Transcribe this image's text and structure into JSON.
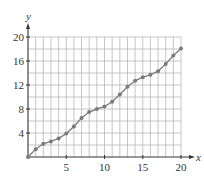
{
  "chart_data": {
    "type": "line",
    "title": "",
    "xlabel": "x",
    "ylabel": "y",
    "xlim": [
      0,
      20
    ],
    "ylim": [
      0,
      20
    ],
    "x_ticks": [
      5,
      10,
      15,
      20
    ],
    "y_ticks": [
      4,
      8,
      12,
      16,
      20
    ],
    "x_tick_labels": [
      "5",
      "10",
      "15",
      "20"
    ],
    "y_tick_labels": [
      "4",
      "8",
      "12",
      "16",
      "20"
    ],
    "grid": true,
    "grid_x_step": 1,
    "grid_y_step": 2,
    "markers": true,
    "legend": null,
    "x": [
      0,
      1,
      2,
      3,
      4,
      5,
      6,
      7,
      8,
      9,
      10,
      11,
      12,
      13,
      14,
      15,
      16,
      17,
      18,
      19,
      20
    ],
    "series": [
      {
        "name": "y",
        "values": [
          0,
          1.3,
          2.2,
          2.6,
          3.1,
          3.9,
          5.1,
          6.5,
          7.5,
          8.0,
          8.4,
          9.2,
          10.4,
          11.7,
          12.7,
          13.3,
          13.7,
          14.3,
          15.5,
          16.9,
          18.1
        ]
      }
    ]
  },
  "colors": {
    "grid": "#b8b8b8",
    "axis": "#333333",
    "line": "#808080",
    "marker": "#7a7a7a"
  }
}
